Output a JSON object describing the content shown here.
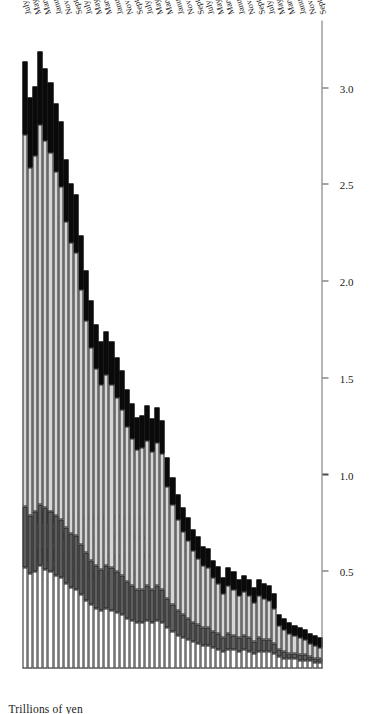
{
  "chart_data": {
    "type": "bar",
    "subtype": "stacked-horizontal",
    "title": "",
    "xlabel": "",
    "ylabel": "Trillions of yen",
    "axis_title": "Trillions of yen",
    "orientation": "rotated-90",
    "value_axis": {
      "ticks": [
        "0.5",
        "1.0",
        "1.5",
        "2.0",
        "2.5",
        "3.0"
      ],
      "tick_values": [
        0.5,
        1.0,
        1.5,
        2.0,
        2.5,
        3.0
      ],
      "range": [
        0,
        3.35
      ],
      "direction": "increasing-leftwards",
      "grid": false
    },
    "legend": {
      "position": "left-inside",
      "entries": [
        {
          "name": "Foreign investors",
          "color": "#ffffff"
        },
        {
          "name": "Business corporations",
          "color": "#5e5e5e"
        },
        {
          "name": "Financial institutions",
          "color": "#d6d6d6"
        },
        {
          "name": "Individual investors",
          "color": "#0a0a0a"
        }
      ]
    },
    "series": [
      {
        "name": "Foreign investors",
        "key": "foreign",
        "color": "#ffffff"
      },
      {
        "name": "Business corporations",
        "key": "business",
        "color": "#5e5e5e"
      },
      {
        "name": "Financial institutions",
        "key": "financial",
        "color": "#d6d6d6"
      },
      {
        "name": "Individual investors",
        "key": "individual",
        "color": "#0a0a0a"
      }
    ],
    "categories": [
      "September 2001",
      "October 2001",
      "November 2001",
      "December 2001",
      "January 2002",
      "February 2002",
      "March 2002",
      "April 2002",
      "May 2002",
      "June 2002",
      "July 2002",
      "August 2002",
      "September 2002",
      "October 2002",
      "November 2002",
      "December 2002",
      "January 2003",
      "February 2003",
      "March 2003",
      "April 2003",
      "May 2003",
      "June 2003",
      "July 2003",
      "August 2003",
      "September 2003",
      "October 2003",
      "November 2003",
      "December 2003",
      "January 2004",
      "February 2004",
      "March 2004",
      "April 2004",
      "May 2004",
      "June 2004",
      "July 2004",
      "August 2004",
      "September 2004",
      "October 2004",
      "November 2004",
      "December 2004",
      "January 2005",
      "February 2005",
      "March 2005",
      "April 2005",
      "May 2005",
      "June 2005",
      "July 2005",
      "August 2005",
      "September 2005",
      "October 2005",
      "November 2005",
      "December 2005",
      "January 2006",
      "February 2006",
      "March 2006",
      "April 2006",
      "May 2006",
      "June 2006",
      "July 2006"
    ],
    "labelled_categories": [
      "September 2001",
      "November 2001",
      "January 2002",
      "March 2002",
      "May 2002",
      "July 2002",
      "September 2002",
      "November 2002",
      "January 2003",
      "March 2003",
      "May 2003",
      "July 2003",
      "September 2003",
      "November 2003",
      "January 2004",
      "March 2004",
      "May 2004",
      "July 2004",
      "September 2004",
      "November 2004",
      "January 2005",
      "March 2005",
      "May 2005",
      "July 2005",
      "September 2005",
      "November 2005",
      "January 2006",
      "March 2006",
      "May 2006",
      "July 2006"
    ],
    "stacks": [
      {
        "category": "September 2001",
        "foreign": 0.03,
        "business": 0.02,
        "financial": 0.06,
        "individual": 0.05,
        "total": 0.16
      },
      {
        "category": "October 2001",
        "foreign": 0.03,
        "business": 0.02,
        "financial": 0.07,
        "individual": 0.05,
        "total": 0.17
      },
      {
        "category": "November 2001",
        "foreign": 0.04,
        "business": 0.02,
        "financial": 0.07,
        "individual": 0.05,
        "total": 0.18
      },
      {
        "category": "December 2001",
        "foreign": 0.04,
        "business": 0.03,
        "financial": 0.08,
        "individual": 0.05,
        "total": 0.2
      },
      {
        "category": "January 2002",
        "foreign": 0.04,
        "business": 0.03,
        "financial": 0.09,
        "individual": 0.05,
        "total": 0.21
      },
      {
        "category": "February 2002",
        "foreign": 0.05,
        "business": 0.03,
        "financial": 0.09,
        "individual": 0.05,
        "total": 0.22
      },
      {
        "category": "March 2002",
        "foreign": 0.05,
        "business": 0.03,
        "financial": 0.1,
        "individual": 0.06,
        "total": 0.24
      },
      {
        "category": "April 2002",
        "foreign": 0.05,
        "business": 0.04,
        "financial": 0.11,
        "individual": 0.06,
        "total": 0.26
      },
      {
        "category": "May 2002",
        "foreign": 0.06,
        "business": 0.04,
        "financial": 0.12,
        "individual": 0.06,
        "total": 0.28
      },
      {
        "category": "June 2002",
        "foreign": 0.08,
        "business": 0.05,
        "financial": 0.18,
        "individual": 0.08,
        "total": 0.39
      },
      {
        "category": "July 2002",
        "foreign": 0.09,
        "business": 0.06,
        "financial": 0.2,
        "individual": 0.08,
        "total": 0.43
      },
      {
        "category": "August 2002",
        "foreign": 0.09,
        "business": 0.06,
        "financial": 0.21,
        "individual": 0.08,
        "total": 0.44
      },
      {
        "category": "September 2002",
        "foreign": 0.09,
        "business": 0.07,
        "financial": 0.22,
        "individual": 0.08,
        "total": 0.46
      },
      {
        "category": "October 2002",
        "foreign": 0.08,
        "business": 0.06,
        "financial": 0.2,
        "individual": 0.08,
        "total": 0.42
      },
      {
        "category": "November 2002",
        "foreign": 0.09,
        "business": 0.07,
        "financial": 0.22,
        "individual": 0.08,
        "total": 0.46
      },
      {
        "category": "December 2002",
        "foreign": 0.1,
        "business": 0.07,
        "financial": 0.23,
        "individual": 0.08,
        "total": 0.48
      },
      {
        "category": "January 2003",
        "foreign": 0.09,
        "business": 0.07,
        "financial": 0.22,
        "individual": 0.08,
        "total": 0.46
      },
      {
        "category": "February 2003",
        "foreign": 0.1,
        "business": 0.07,
        "financial": 0.24,
        "individual": 0.09,
        "total": 0.5
      },
      {
        "category": "March 2003",
        "foreign": 0.1,
        "business": 0.08,
        "financial": 0.25,
        "individual": 0.09,
        "total": 0.52
      },
      {
        "category": "April 2003",
        "foreign": 0.09,
        "business": 0.07,
        "financial": 0.23,
        "individual": 0.08,
        "total": 0.47
      },
      {
        "category": "May 2003",
        "foreign": 0.1,
        "business": 0.08,
        "financial": 0.26,
        "individual": 0.09,
        "total": 0.53
      },
      {
        "category": "June 2003",
        "foreign": 0.11,
        "business": 0.08,
        "financial": 0.28,
        "individual": 0.09,
        "total": 0.56
      },
      {
        "category": "July 2003",
        "foreign": 0.12,
        "business": 0.09,
        "financial": 0.31,
        "individual": 0.1,
        "total": 0.62
      },
      {
        "category": "August 2003",
        "foreign": 0.12,
        "business": 0.09,
        "financial": 0.32,
        "individual": 0.1,
        "total": 0.63
      },
      {
        "category": "September 2003",
        "foreign": 0.13,
        "business": 0.1,
        "financial": 0.34,
        "individual": 0.11,
        "total": 0.68
      },
      {
        "category": "October 2003",
        "foreign": 0.14,
        "business": 0.1,
        "financial": 0.37,
        "individual": 0.11,
        "total": 0.72
      },
      {
        "category": "November 2003",
        "foreign": 0.15,
        "business": 0.11,
        "financial": 0.4,
        "individual": 0.12,
        "total": 0.78
      },
      {
        "category": "December 2003",
        "foreign": 0.16,
        "business": 0.12,
        "financial": 0.43,
        "individual": 0.12,
        "total": 0.83
      },
      {
        "category": "January 2004",
        "foreign": 0.17,
        "business": 0.13,
        "financial": 0.47,
        "individual": 0.13,
        "total": 0.9
      },
      {
        "category": "February 2004",
        "foreign": 0.19,
        "business": 0.14,
        "financial": 0.52,
        "individual": 0.14,
        "total": 0.99
      },
      {
        "category": "March 2004",
        "foreign": 0.21,
        "business": 0.15,
        "financial": 0.58,
        "individual": 0.15,
        "total": 1.09
      },
      {
        "category": "April 2004",
        "foreign": 0.24,
        "business": 0.17,
        "financial": 0.7,
        "individual": 0.17,
        "total": 1.28
      },
      {
        "category": "May 2004",
        "foreign": 0.25,
        "business": 0.18,
        "financial": 0.74,
        "individual": 0.18,
        "total": 1.35
      },
      {
        "category": "June 2004",
        "foreign": 0.24,
        "business": 0.17,
        "financial": 0.71,
        "individual": 0.17,
        "total": 1.29
      },
      {
        "category": "July 2004",
        "foreign": 0.25,
        "business": 0.18,
        "financial": 0.75,
        "individual": 0.18,
        "total": 1.36
      },
      {
        "category": "August 2004",
        "foreign": 0.24,
        "business": 0.17,
        "financial": 0.73,
        "individual": 0.17,
        "total": 1.31
      },
      {
        "category": "September 2004",
        "foreign": 0.24,
        "business": 0.17,
        "financial": 0.72,
        "individual": 0.17,
        "total": 1.3
      },
      {
        "category": "October 2004",
        "foreign": 0.25,
        "business": 0.18,
        "financial": 0.76,
        "individual": 0.18,
        "total": 1.37
      },
      {
        "category": "November 2004",
        "foreign": 0.26,
        "business": 0.19,
        "financial": 0.8,
        "individual": 0.19,
        "total": 1.44
      },
      {
        "category": "December 2004",
        "foreign": 0.28,
        "business": 0.2,
        "financial": 0.86,
        "individual": 0.2,
        "total": 1.54
      },
      {
        "category": "January 2005",
        "foreign": 0.29,
        "business": 0.21,
        "financial": 0.9,
        "individual": 0.21,
        "total": 1.61
      },
      {
        "category": "February 2005",
        "foreign": 0.3,
        "business": 0.22,
        "financial": 0.95,
        "individual": 0.22,
        "total": 1.69
      },
      {
        "category": "March 2005",
        "foreign": 0.31,
        "business": 0.22,
        "financial": 0.99,
        "individual": 0.22,
        "total": 1.74
      },
      {
        "category": "April 2005",
        "foreign": 0.3,
        "business": 0.21,
        "financial": 0.96,
        "individual": 0.22,
        "total": 1.69
      },
      {
        "category": "May 2005",
        "foreign": 0.31,
        "business": 0.22,
        "financial": 1.02,
        "individual": 0.23,
        "total": 1.78
      },
      {
        "category": "June 2005",
        "foreign": 0.33,
        "business": 0.23,
        "financial": 1.1,
        "individual": 0.24,
        "total": 1.9
      },
      {
        "category": "July 2005",
        "foreign": 0.35,
        "business": 0.25,
        "financial": 1.2,
        "individual": 0.26,
        "total": 2.06
      },
      {
        "category": "August 2005",
        "foreign": 0.38,
        "business": 0.26,
        "financial": 1.32,
        "individual": 0.28,
        "total": 2.24
      },
      {
        "category": "September 2005",
        "foreign": 0.41,
        "business": 0.28,
        "financial": 1.46,
        "individual": 0.3,
        "total": 2.45
      },
      {
        "category": "October 2005",
        "foreign": 0.42,
        "business": 0.28,
        "financial": 1.5,
        "individual": 0.31,
        "total": 2.51
      },
      {
        "category": "November 2005",
        "foreign": 0.44,
        "business": 0.29,
        "financial": 1.58,
        "individual": 0.32,
        "total": 2.63
      },
      {
        "category": "December 2005",
        "foreign": 0.47,
        "business": 0.3,
        "financial": 1.72,
        "individual": 0.34,
        "total": 2.83
      },
      {
        "category": "January 2006",
        "foreign": 0.48,
        "business": 0.31,
        "financial": 1.78,
        "individual": 0.35,
        "total": 2.92
      },
      {
        "category": "February 2006",
        "foreign": 0.5,
        "business": 0.31,
        "financial": 1.86,
        "individual": 0.36,
        "total": 3.03
      },
      {
        "category": "March 2006",
        "foreign": 0.51,
        "business": 0.32,
        "financial": 1.9,
        "individual": 0.37,
        "total": 3.1
      },
      {
        "category": "April 2006",
        "foreign": 0.53,
        "business": 0.32,
        "financial": 1.96,
        "individual": 0.38,
        "total": 3.19
      },
      {
        "category": "May 2006",
        "foreign": 0.5,
        "business": 0.31,
        "financial": 1.84,
        "individual": 0.36,
        "total": 3.01
      },
      {
        "category": "June 2006",
        "foreign": 0.49,
        "business": 0.3,
        "financial": 1.8,
        "individual": 0.36,
        "total": 2.95
      },
      {
        "category": "July 2006",
        "foreign": 0.52,
        "business": 0.32,
        "financial": 1.92,
        "individual": 0.38,
        "total": 3.14
      }
    ]
  }
}
